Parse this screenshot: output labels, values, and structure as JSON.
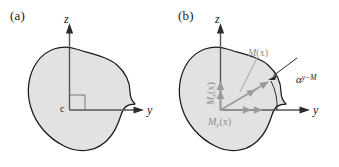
{
  "figure": {
    "background_color": "#ffffff",
    "blob_fill_color": "#e2e2e2",
    "blob_stroke_color": "#1a1a1a",
    "axis_color": "#555555",
    "vector_color": "#9a9a9a",
    "text_color": "#1a1a1a"
  },
  "panels": [
    {
      "id": "a",
      "label": "(a)",
      "axes": {
        "vertical_label": "z",
        "horizontal_label": "y",
        "origin_label": "c"
      }
    },
    {
      "id": "b",
      "label": "(b)",
      "axes": {
        "vertical_label": "z",
        "horizontal_label": "y"
      },
      "vectors": [
        {
          "name": "resultant",
          "label_base": "M",
          "label_sub": "",
          "label_arg": "(x)"
        },
        {
          "name": "z-component",
          "label_base": "M",
          "label_sub": "z",
          "label_arg": "(x)"
        },
        {
          "name": "y-component",
          "label_base": "M",
          "label_sub": "y",
          "label_arg": "(x)"
        }
      ],
      "angle": {
        "base": "α",
        "superscript": "y−M"
      }
    }
  ]
}
